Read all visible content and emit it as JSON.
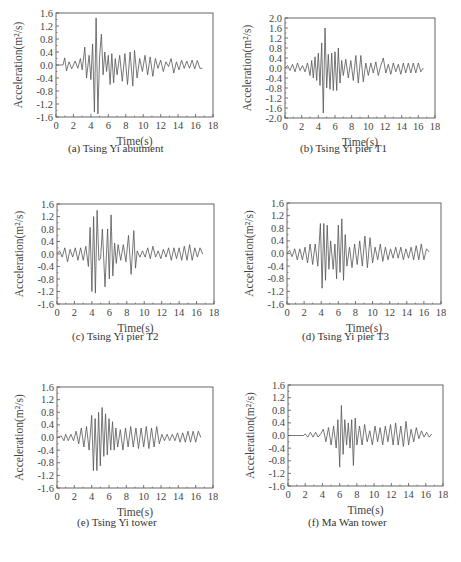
{
  "chart_data": [
    {
      "id": "a",
      "type": "line",
      "title": "",
      "caption": "(a) Tsing Yi abutment",
      "xlabel": "Time(s)",
      "ylabel": "Acceleration(m²/s)",
      "xlim": [
        0,
        18
      ],
      "ylim": [
        -1.6,
        1.6
      ],
      "xticks": [
        "0",
        "2",
        "4",
        "6",
        "8",
        "10",
        "12",
        "14",
        "16",
        "18"
      ],
      "yticks": [
        "1.6",
        "1.2",
        "0.8",
        "0.4",
        "0.0",
        "-0.4",
        "-0.8",
        "-1.2",
        "-1.6"
      ],
      "grid": false,
      "frame": {
        "x": 56,
        "y": 13,
        "w": 157,
        "h": 104
      },
      "caption_pos": {
        "x": 68,
        "y": 153
      },
      "series": [
        {
          "name": "acceleration",
          "x": [
            0,
            0.8,
            1.0,
            1.2,
            1.5,
            1.8,
            2.2,
            2.5,
            2.8,
            3.0,
            3.3,
            3.5,
            3.8,
            4.0,
            4.2,
            4.4,
            4.6,
            4.8,
            5.0,
            5.2,
            5.4,
            5.6,
            5.8,
            6.0,
            6.2,
            6.4,
            6.6,
            6.8,
            7.0,
            7.3,
            7.6,
            7.9,
            8.2,
            8.5,
            8.8,
            9.0,
            9.3,
            9.6,
            9.9,
            10.2,
            10.5,
            10.8,
            11.1,
            11.4,
            11.7,
            12.0,
            12.3,
            12.6,
            12.9,
            13.2,
            13.5,
            13.8,
            14.1,
            14.4,
            14.7,
            15.0,
            15.3,
            15.6,
            15.9,
            16.2,
            16.5,
            16.8
          ],
          "y": [
            0,
            0,
            0.22,
            -0.18,
            0.1,
            -0.12,
            0.12,
            -0.1,
            0.2,
            -0.15,
            0.55,
            -0.4,
            0.3,
            -0.45,
            0.65,
            -1.45,
            1.45,
            -1.5,
            0.25,
            0.95,
            -0.3,
            0.4,
            -0.2,
            0.3,
            -0.6,
            0.35,
            -0.55,
            0.2,
            -0.3,
            0.3,
            -0.5,
            0.35,
            -0.6,
            0.4,
            -0.65,
            0.45,
            -0.4,
            0.2,
            -0.2,
            0.3,
            -0.3,
            0.25,
            -0.35,
            0.2,
            -0.1,
            0.15,
            -0.2,
            0.1,
            -0.05,
            0.2,
            -0.25,
            0.1,
            -0.15,
            0.15,
            -0.1,
            0.12,
            -0.1,
            0.15,
            -0.12,
            0.14,
            -0.1,
            -0.1
          ]
        }
      ]
    },
    {
      "id": "b",
      "type": "line",
      "title": "",
      "caption": "(b) Tsing Yi pier T1",
      "xlabel": "Time(s)",
      "ylabel": "Acceleration(m²/s)",
      "xlim": [
        0,
        18
      ],
      "ylim": [
        -2.0,
        2.0
      ],
      "xticks": [
        "0",
        "2",
        "4",
        "6",
        "8",
        "10",
        "12",
        "14",
        "16",
        "18"
      ],
      "yticks": [
        "2.0",
        "1.6",
        "1.2",
        "0.8",
        "0.4",
        "0.0",
        "-0.4",
        "-0.8",
        "-1.2",
        "-1.6",
        "-2.0"
      ],
      "grid": false,
      "frame": {
        "x": 285,
        "y": 18,
        "w": 150,
        "h": 100
      },
      "caption_pos": {
        "x": 300,
        "y": 153
      },
      "series": [
        {
          "name": "acceleration",
          "x": [
            0,
            0.3,
            0.6,
            0.9,
            1.2,
            1.5,
            1.8,
            2.1,
            2.4,
            2.7,
            3.0,
            3.2,
            3.4,
            3.6,
            3.8,
            4.0,
            4.2,
            4.4,
            4.6,
            4.8,
            5.0,
            5.2,
            5.4,
            5.6,
            5.8,
            6.0,
            6.2,
            6.4,
            6.6,
            6.8,
            7.0,
            7.3,
            7.6,
            7.9,
            8.2,
            8.5,
            8.8,
            9.1,
            9.4,
            9.7,
            10.0,
            10.3,
            10.6,
            10.9,
            11.2,
            11.5,
            11.8,
            12.1,
            12.4,
            12.7,
            13.0,
            13.3,
            13.6,
            13.9,
            14.2,
            14.5,
            14.8,
            15.1,
            15.4,
            15.7,
            16.0,
            16.3,
            16.6
          ],
          "y": [
            0,
            0.1,
            -0.1,
            0.15,
            -0.15,
            0.2,
            -0.1,
            0.1,
            -0.15,
            0.2,
            -0.3,
            0.3,
            -0.4,
            0.45,
            -0.5,
            0.6,
            -0.7,
            1.0,
            -1.8,
            1.6,
            -0.8,
            0.55,
            -0.85,
            0.6,
            -0.9,
            0.65,
            -0.9,
            0.8,
            -0.6,
            0.3,
            -0.3,
            0.35,
            -0.4,
            0.3,
            -0.5,
            0.5,
            -0.6,
            0.5,
            -0.55,
            0.2,
            -0.3,
            0.2,
            -0.2,
            0.25,
            -0.3,
            0.1,
            0.4,
            -0.2,
            0.15,
            -0.25,
            0.2,
            -0.15,
            0.15,
            -0.25,
            0.2,
            -0.2,
            0.2,
            -0.2,
            0.2,
            -0.2,
            0.2,
            -0.15,
            0
          ]
        }
      ]
    },
    {
      "id": "c",
      "type": "line",
      "title": "",
      "caption": "(c) Tsing Yi pier T2",
      "xlabel": "Time(s)",
      "ylabel": "Acceleration(m²/s)",
      "xlim": [
        0,
        18
      ],
      "ylim": [
        -1.6,
        1.6
      ],
      "xticks": [
        "0",
        "2",
        "4",
        "6",
        "8",
        "10",
        "12",
        "14",
        "16",
        "18"
      ],
      "yticks": [
        "1.6",
        "1.2",
        "0.8",
        "0.4",
        "0.0",
        "-0.4",
        "-0.8",
        "-1.2",
        "-1.6"
      ],
      "grid": false,
      "frame": {
        "x": 57,
        "y": 204,
        "w": 157,
        "h": 100
      },
      "caption_pos": {
        "x": 72,
        "y": 341
      },
      "series": [
        {
          "name": "acceleration",
          "x": [
            0,
            0.3,
            0.6,
            0.9,
            1.2,
            1.5,
            1.8,
            2.1,
            2.4,
            2.7,
            3.0,
            3.3,
            3.6,
            3.8,
            4.0,
            4.2,
            4.4,
            4.6,
            4.8,
            5.0,
            5.2,
            5.5,
            5.8,
            6.0,
            6.2,
            6.4,
            6.6,
            6.8,
            7.0,
            7.3,
            7.6,
            7.9,
            8.2,
            8.5,
            8.8,
            9.0,
            9.2,
            9.5,
            9.8,
            10.1,
            10.4,
            10.7,
            11.0,
            11.3,
            11.6,
            11.9,
            12.2,
            12.5,
            12.8,
            13.1,
            13.4,
            13.7,
            14.0,
            14.3,
            14.6,
            14.9,
            15.2,
            15.5,
            15.8,
            16.1,
            16.4,
            16.7
          ],
          "y": [
            0,
            0.1,
            -0.1,
            0.2,
            -0.25,
            0.15,
            -0.1,
            0.2,
            -0.2,
            0.2,
            -0.2,
            0.25,
            -0.4,
            0.85,
            -1.2,
            1.2,
            -1.25,
            1.4,
            -0.2,
            -0.15,
            0.8,
            -1.05,
            0.8,
            -0.8,
            1.25,
            -0.7,
            0.35,
            -0.3,
            0.3,
            -0.2,
            0.3,
            -0.25,
            0.6,
            -0.65,
            0.75,
            -0.45,
            0.1,
            -0.1,
            0.1,
            -0.1,
            0.2,
            -0.15,
            0.25,
            -0.1,
            0.1,
            -0.15,
            0.15,
            -0.1,
            0.2,
            -0.2,
            0.2,
            -0.15,
            0.2,
            -0.2,
            0.25,
            -0.2,
            0.3,
            -0.2,
            0.2,
            -0.1,
            0.2,
            0
          ]
        }
      ]
    },
    {
      "id": "d",
      "type": "line",
      "title": "",
      "caption": "(d) Tsing Yi pier T3",
      "xlabel": "Time(s)",
      "ylabel": "Acceleration(m²/s)",
      "xlim": [
        0,
        18
      ],
      "ylim": [
        -1.6,
        1.6
      ],
      "xticks": [
        "0",
        "2",
        "4",
        "6",
        "8",
        "10",
        "12",
        "14",
        "16",
        "18"
      ],
      "yticks": [
        "1.6",
        "1.2",
        "0.8",
        "0.4",
        "0.0",
        "-0.4",
        "-0.8",
        "-1.2",
        "-1.6"
      ],
      "grid": false,
      "frame": {
        "x": 287,
        "y": 203,
        "w": 154,
        "h": 101
      },
      "caption_pos": {
        "x": 302,
        "y": 341
      },
      "series": [
        {
          "name": "acceleration",
          "x": [
            0,
            0.3,
            0.6,
            0.9,
            1.2,
            1.5,
            1.8,
            2.1,
            2.4,
            2.7,
            3.0,
            3.3,
            3.6,
            3.9,
            4.1,
            4.3,
            4.5,
            4.7,
            4.9,
            5.1,
            5.4,
            5.6,
            5.8,
            6.0,
            6.2,
            6.4,
            6.6,
            6.8,
            7.0,
            7.3,
            7.6,
            7.9,
            8.2,
            8.5,
            8.8,
            9.1,
            9.4,
            9.7,
            10.0,
            10.3,
            10.6,
            10.9,
            11.2,
            11.5,
            11.8,
            12.1,
            12.4,
            12.7,
            13.0,
            13.3,
            13.6,
            13.9,
            14.2,
            14.5,
            14.8,
            15.1,
            15.4,
            15.7,
            16.0,
            16.3,
            16.6
          ],
          "y": [
            0,
            0.1,
            -0.1,
            0.15,
            -0.2,
            0.15,
            -0.2,
            0.2,
            -0.3,
            0.3,
            -0.35,
            0.3,
            -0.4,
            0.95,
            -1.1,
            0.95,
            -0.85,
            0.9,
            -0.5,
            0.4,
            -0.5,
            0.3,
            -0.8,
            0.9,
            -0.6,
            1.1,
            -0.85,
            0.6,
            -0.4,
            0.2,
            -0.45,
            0.3,
            -0.35,
            0.4,
            -0.4,
            0.55,
            -0.45,
            0.5,
            -0.3,
            0.2,
            -0.2,
            0.3,
            -0.25,
            0.2,
            -0.2,
            0.15,
            -0.15,
            0.2,
            -0.15,
            0.2,
            -0.2,
            0.15,
            -0.15,
            0.2,
            -0.2,
            0.25,
            -0.2,
            0.3,
            -0.2,
            0.15,
            0.05
          ]
        }
      ]
    },
    {
      "id": "e",
      "type": "line",
      "title": "",
      "caption": "(e) Tsing Yi tower",
      "xlabel": "Time(s)",
      "ylabel": "Acceleration(m²/s)",
      "xlim": [
        0,
        18
      ],
      "ylim": [
        -1.6,
        1.6
      ],
      "xticks": [
        "0",
        "2",
        "4",
        "6",
        "8",
        "10",
        "12",
        "14",
        "16",
        "18"
      ],
      "yticks": [
        "1.6",
        "1.2",
        "0.8",
        "0.4",
        "0.0",
        "-0.4",
        "-0.8",
        "-1.2",
        "-1.6"
      ],
      "grid": false,
      "frame": {
        "x": 57,
        "y": 387,
        "w": 156,
        "h": 101
      },
      "caption_pos": {
        "x": 77,
        "y": 527
      },
      "series": [
        {
          "name": "acceleration",
          "x": [
            0,
            0.5,
            0.8,
            1.0,
            1.3,
            1.6,
            1.9,
            2.2,
            2.5,
            2.8,
            3.1,
            3.4,
            3.7,
            4.0,
            4.2,
            4.4,
            4.6,
            4.8,
            5.0,
            5.2,
            5.4,
            5.6,
            5.8,
            6.0,
            6.2,
            6.4,
            6.6,
            6.8,
            7.0,
            7.3,
            7.6,
            7.9,
            8.2,
            8.5,
            8.8,
            9.1,
            9.4,
            9.7,
            10.0,
            10.3,
            10.6,
            10.9,
            11.2,
            11.5,
            11.8,
            12.1,
            12.4,
            12.7,
            13.0,
            13.3,
            13.6,
            13.9,
            14.2,
            14.5,
            14.8,
            15.1,
            15.4,
            15.7,
            16.0,
            16.3,
            16.6
          ],
          "y": [
            0,
            0.05,
            -0.1,
            0.1,
            -0.1,
            0.1,
            -0.1,
            0.2,
            -0.2,
            0.3,
            -0.3,
            0.35,
            -0.4,
            0.7,
            -1.05,
            0.6,
            -1.05,
            0.8,
            -0.9,
            0.95,
            -0.6,
            0.75,
            -0.55,
            0.6,
            -0.4,
            0.5,
            -0.4,
            0.3,
            -0.3,
            0.25,
            -0.4,
            0.3,
            -0.3,
            0.35,
            -0.3,
            0.3,
            -0.35,
            0.3,
            -0.3,
            0.35,
            -0.35,
            0.3,
            -0.3,
            0.35,
            -0.2,
            0.1,
            -0.1,
            0.1,
            -0.1,
            0.1,
            -0.1,
            0.15,
            -0.15,
            0.15,
            -0.15,
            0.2,
            -0.15,
            0.2,
            -0.15,
            0.2,
            0
          ]
        }
      ]
    },
    {
      "id": "f",
      "type": "line",
      "title": "",
      "caption": "(f) Ma Wan tower",
      "xlabel": "Time(s)",
      "ylabel": "Acceleration(m²/s)",
      "xlim": [
        0,
        18
      ],
      "ylim": [
        -1.6,
        1.6
      ],
      "xticks": [
        "0",
        "2",
        "4",
        "6",
        "8",
        "10",
        "12",
        "14",
        "16",
        "18"
      ],
      "yticks": [
        "1.6",
        "1.2",
        "0.8",
        "0.4",
        "0.0",
        "-0.4",
        "-0.8",
        "-1.2",
        "-1.6"
      ],
      "grid": false,
      "frame": {
        "x": 288,
        "y": 385,
        "w": 155,
        "h": 101
      },
      "caption_pos": {
        "x": 308,
        "y": 527
      },
      "series": [
        {
          "name": "acceleration",
          "x": [
            0,
            1.8,
            2.0,
            2.3,
            2.6,
            2.9,
            3.2,
            3.5,
            3.8,
            4.1,
            4.4,
            4.7,
            5.0,
            5.3,
            5.6,
            5.8,
            6.0,
            6.2,
            6.4,
            6.6,
            6.8,
            7.0,
            7.2,
            7.4,
            7.6,
            7.8,
            8.0,
            8.3,
            8.6,
            8.9,
            9.2,
            9.5,
            9.8,
            10.1,
            10.4,
            10.7,
            11.0,
            11.3,
            11.6,
            11.9,
            12.2,
            12.5,
            12.8,
            13.1,
            13.4,
            13.7,
            14.0,
            14.3,
            14.6,
            14.9,
            15.2,
            15.5,
            15.8,
            16.1,
            16.4,
            16.7
          ],
          "y": [
            0,
            0,
            0.05,
            -0.05,
            0.1,
            -0.05,
            0.1,
            -0.05,
            0.05,
            0.2,
            -0.2,
            0.25,
            -0.3,
            0.3,
            -0.4,
            0.5,
            -1.0,
            0.95,
            -0.6,
            0.5,
            -0.3,
            0.4,
            -0.4,
            0.5,
            -0.95,
            0.55,
            -0.3,
            0.3,
            -0.3,
            0.35,
            -0.2,
            0.15,
            -0.3,
            0.3,
            -0.2,
            0.25,
            -0.3,
            0.3,
            -0.2,
            0.35,
            -0.3,
            0.4,
            -0.3,
            0.3,
            -0.35,
            0.45,
            -0.3,
            0.2,
            -0.2,
            0.25,
            -0.1,
            0.15,
            -0.05,
            0.1,
            -0.05,
            0.05
          ]
        }
      ]
    }
  ]
}
